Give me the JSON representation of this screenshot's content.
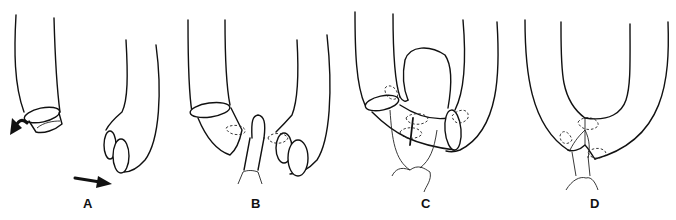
{
  "figure": {
    "panels": [
      {
        "id": "A",
        "label": "A",
        "description": "Two separated bowel limbs with cut ends; curved arrows indicate rotation"
      },
      {
        "id": "B",
        "label": "B",
        "description": "Limbs approximated with a central stump and stay sutures"
      },
      {
        "id": "C",
        "label": "C",
        "description": "Anastomosis in progress with sutures across the joined walls"
      },
      {
        "id": "D",
        "label": "D",
        "description": "Completed U-shaped anastomosis with tied sutures"
      }
    ],
    "icons": [
      "curved-arrow-icon",
      "straight-arrow-icon"
    ]
  }
}
